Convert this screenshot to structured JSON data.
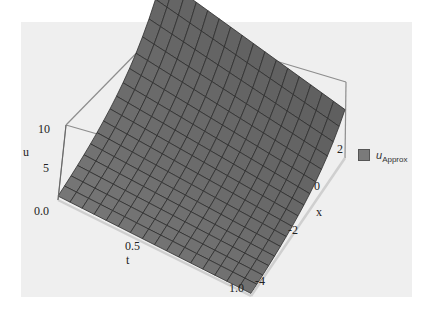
{
  "chart_data": {
    "type": "surface3d",
    "title": "",
    "series_name": "u_Approx",
    "axes": {
      "t": {
        "label": "t",
        "range": [
          0.0,
          1.0
        ],
        "ticks": [
          "0.0",
          "0.5",
          "1.0"
        ]
      },
      "x": {
        "label": "x",
        "range": [
          -4,
          3
        ],
        "ticks": [
          "-4",
          "-2",
          "0",
          "2"
        ]
      },
      "u": {
        "label": "u",
        "range": [
          0,
          11
        ],
        "ticks": [
          "5",
          "10"
        ]
      }
    },
    "surface_description": "u ≈ 0 along t=0 edge and near t=1, rising steeply toward large x / small t corner (~10-11); exponential-like growth in x",
    "mesh": {
      "t_lines": 16,
      "x_lines": 16
    },
    "colors": {
      "surface": "#6f6f6f",
      "mesh": "#2f2f2f",
      "box": "#8a8a8a",
      "panel": "#efefef"
    },
    "legend": {
      "position": "right",
      "entries": [
        {
          "label": "u",
          "subscript": "Approx",
          "color": "#7a7a7a"
        }
      ]
    }
  },
  "legend": {
    "label": "u",
    "subscript": "Approx"
  }
}
